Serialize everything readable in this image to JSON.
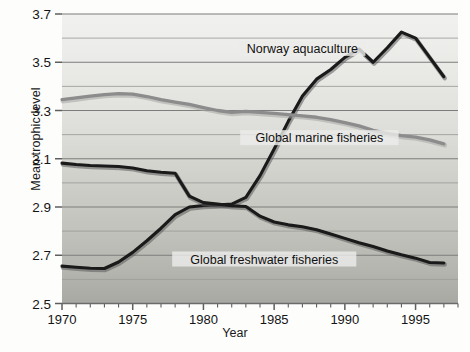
{
  "chart_data": {
    "type": "line",
    "title": "",
    "xlabel": "Year",
    "ylabel": "Mean trophic level",
    "xlim": [
      1970,
      1998
    ],
    "ylim": [
      2.5,
      3.7
    ],
    "ytick_step": 0.2,
    "gridline_step": 0.1,
    "xtick_step": 1,
    "xticklabel_step": 5,
    "grid": true,
    "legend_position": "inline-annotations",
    "xticklabels": [
      "1970",
      "1975",
      "1980",
      "1985",
      "1990",
      "1995"
    ],
    "xticklabel_values": [
      1970,
      1975,
      1980,
      1985,
      1990,
      1995
    ],
    "yticklabels": [
      "2.5",
      "2.7",
      "2.9",
      "3.1",
      "3.3",
      "3.5",
      "3.7"
    ],
    "yticklabel_values": [
      2.5,
      2.7,
      2.9,
      3.1,
      3.3,
      3.5,
      3.7
    ],
    "x": [
      1970,
      1971,
      1972,
      1973,
      1974,
      1975,
      1976,
      1977,
      1978,
      1979,
      1980,
      1981,
      1982,
      1983,
      1984,
      1985,
      1986,
      1987,
      1988,
      1989,
      1990,
      1991,
      1992,
      1993,
      1994,
      1995,
      1996,
      1997
    ],
    "series": [
      {
        "name": "Norway aquaculture",
        "color": "#1a1a1a",
        "label_x": 1987.0,
        "label_y": 3.545,
        "values": [
          2.655,
          2.65,
          2.646,
          2.645,
          2.672,
          2.712,
          2.76,
          2.812,
          2.868,
          2.9,
          2.906,
          2.908,
          2.912,
          2.94,
          3.03,
          3.14,
          3.255,
          3.36,
          3.43,
          3.47,
          3.52,
          3.555,
          3.5,
          3.56,
          3.625,
          3.6,
          3.52,
          3.44
        ]
      },
      {
        "name": "Global marine fisheries",
        "color": "#8c8c8c",
        "label_x": 1988.2,
        "label_y": 3.175,
        "values": [
          3.345,
          3.352,
          3.36,
          3.366,
          3.37,
          3.368,
          3.358,
          3.345,
          3.335,
          3.325,
          3.312,
          3.3,
          3.292,
          3.296,
          3.292,
          3.288,
          3.283,
          3.278,
          3.272,
          3.262,
          3.25,
          3.236,
          3.218,
          3.205,
          3.196,
          3.19,
          3.178,
          3.162
        ]
      },
      {
        "name": "Global freshwater fisheries",
        "color": "#1a1a1a",
        "label_x": 1984.3,
        "label_y": 2.672,
        "values": [
          3.082,
          3.076,
          3.072,
          3.07,
          3.068,
          3.062,
          3.05,
          3.044,
          3.04,
          2.945,
          2.918,
          2.912,
          2.905,
          2.902,
          2.862,
          2.838,
          2.826,
          2.818,
          2.806,
          2.788,
          2.77,
          2.752,
          2.736,
          2.718,
          2.702,
          2.688,
          2.67,
          2.668
        ]
      }
    ]
  }
}
